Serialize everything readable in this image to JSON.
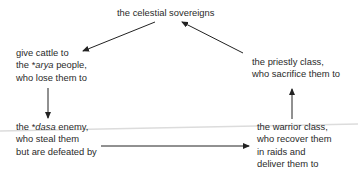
{
  "diagram": {
    "type": "cycle",
    "nodes": {
      "sovereigns": {
        "lines": [
          "the celestial sovereigns"
        ]
      },
      "arya": {
        "line1": "give cattle to",
        "line2_prefix": "the *",
        "line2_italic": "arya",
        "line2_suffix": " people,",
        "line3": "who lose them to"
      },
      "dasa": {
        "line1_prefix": "the *",
        "line1_italic": "dasa",
        "line1_suffix": " enemy,",
        "line2": "who steal them",
        "line3": "but are defeated by"
      },
      "warrior": {
        "lines": [
          "the warrior class,",
          "who recover them",
          "in raids and",
          "deliver them to"
        ]
      },
      "priestly": {
        "lines": [
          "the priestly class,",
          "who sacrifice them to"
        ]
      }
    },
    "edges": [
      {
        "from": "sovereigns",
        "to": "arya"
      },
      {
        "from": "arya",
        "to": "dasa"
      },
      {
        "from": "dasa",
        "to": "warrior"
      },
      {
        "from": "warrior",
        "to": "priestly"
      },
      {
        "from": "priestly",
        "to": "sovereigns"
      }
    ],
    "colors": {
      "text": "#2a2a2a",
      "arrow": "#222222",
      "background": "#ffffff",
      "scan_line": "#d9d9d9"
    }
  }
}
